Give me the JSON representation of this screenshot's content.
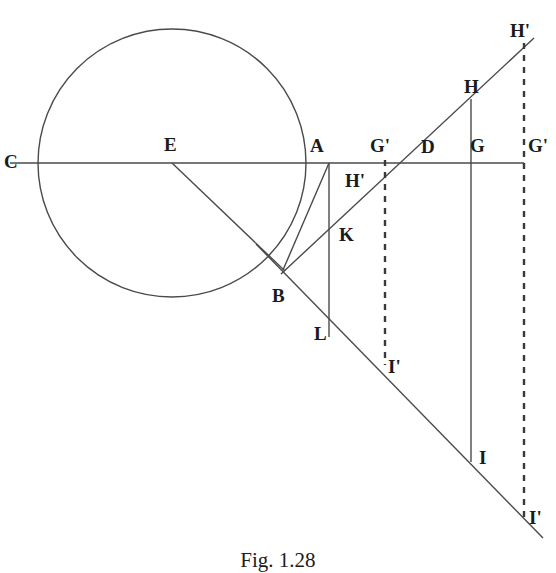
{
  "figure": {
    "caption": "Fig. 1.28",
    "stroke_color": "#4a4a4a",
    "label_color": "#1b1b1b",
    "background_color": "#ffffff",
    "width": 556,
    "height": 570
  },
  "labels": [
    {
      "id": "C",
      "text": "C",
      "x": 4,
      "y": 152
    },
    {
      "id": "E",
      "text": "E",
      "x": 164,
      "y": 135
    },
    {
      "id": "A",
      "text": "A",
      "x": 310,
      "y": 136
    },
    {
      "id": "Gp1",
      "text": "G'",
      "x": 370,
      "y": 136
    },
    {
      "id": "D",
      "text": "D",
      "x": 421,
      "y": 137
    },
    {
      "id": "G",
      "text": "G",
      "x": 470,
      "y": 136
    },
    {
      "id": "Gp2",
      "text": "G'",
      "x": 528,
      "y": 136
    },
    {
      "id": "Hp1",
      "text": "H'",
      "x": 345,
      "y": 171
    },
    {
      "id": "K",
      "text": "K",
      "x": 339,
      "y": 225
    },
    {
      "id": "B",
      "text": "B",
      "x": 272,
      "y": 286
    },
    {
      "id": "L",
      "text": "L",
      "x": 314,
      "y": 324
    },
    {
      "id": "Ip1",
      "text": "I'",
      "x": 388,
      "y": 357
    },
    {
      "id": "H",
      "text": "H",
      "x": 464,
      "y": 77
    },
    {
      "id": "Hp2",
      "text": "H'",
      "x": 510,
      "y": 21
    },
    {
      "id": "I",
      "text": "I",
      "x": 479,
      "y": 448
    },
    {
      "id": "Ip2",
      "text": "I'",
      "x": 529,
      "y": 508
    }
  ],
  "geometry": {
    "circle": {
      "cx": 172,
      "cy": 163,
      "r": 134
    },
    "axis_line": {
      "x1": 10,
      "y1": 163,
      "x2": 524,
      "y2": 163
    },
    "radius_EB": {
      "x1": 172,
      "y1": 163,
      "x2": 285,
      "y2": 271
    },
    "chord_AB": {
      "x1": 329,
      "y1": 163,
      "x2": 283,
      "y2": 270
    },
    "ascending_line": {
      "x1": 281,
      "y1": 274,
      "x2": 534,
      "y2": 38
    },
    "descending_line": {
      "x1": 256,
      "y1": 244,
      "x2": 543,
      "y2": 538
    },
    "vertical_A_L": {
      "x": 329,
      "y1": 163,
      "y2": 337
    },
    "vertical_G_HI": {
      "x": 471,
      "y1": 99,
      "y2": 462
    },
    "dashed_left": {
      "x": 385,
      "y1": 160,
      "y2": 365
    },
    "dashed_right": {
      "x": 524,
      "y1": 43,
      "y2": 522
    }
  }
}
